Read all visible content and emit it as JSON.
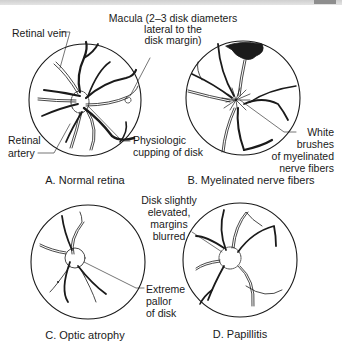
{
  "panels": [
    {
      "id": "A",
      "caption": "A. Normal retina",
      "labels": {
        "retinal_vein": "Retinal vein",
        "macula_line1": "Macula (2–3 disk diameters",
        "macula_line2": "lateral to the",
        "macula_line3": "disk margin)",
        "retinal_artery_line1": "Retinal",
        "retinal_artery_line2": "artery",
        "cupping_line1": "Physiologic",
        "cupping_line2": "cupping of disk"
      }
    },
    {
      "id": "B",
      "caption": "B. Myelinated nerve fibers",
      "labels": {
        "white_line1": "White",
        "white_line2": "brushes",
        "white_line3": "of myelinated",
        "white_line4": "nerve fibers"
      }
    },
    {
      "id": "C",
      "caption": "C. Optic atrophy",
      "labels": {
        "pallor_line1": "Extreme",
        "pallor_line2": "pallor",
        "pallor_line3": "of disk"
      }
    },
    {
      "id": "D",
      "caption": "D. Papillitis",
      "labels": {
        "disk_line1": "Disk slightly",
        "disk_line2": "elevated,",
        "disk_line3": "margins",
        "disk_line4": "blurred"
      }
    }
  ],
  "colors": {
    "ink": "#1a1a1a",
    "paper": "#ffffff",
    "topbar": "#d8d8d8"
  }
}
